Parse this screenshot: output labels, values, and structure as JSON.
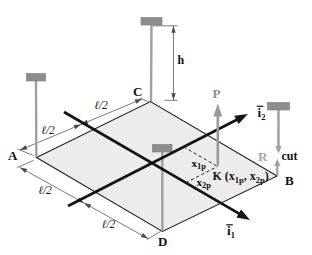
{
  "colors": {
    "background": "#ffffff",
    "plate_fill": "#ececec",
    "plate_edge": "#1f1f1f",
    "support_bar_gray": "#8d8d8d",
    "support_rod_gray": "#a0a0a0",
    "force_gray": "#9a9a9a",
    "axis_black": "#141414",
    "dimension_gray": "#6b6b6b"
  },
  "plate": {
    "corner_a": "A",
    "corner_b": "B",
    "corner_c": "C",
    "corner_d": "D"
  },
  "dimensions": {
    "half_span": "ℓ/2",
    "height": "h"
  },
  "forces": {
    "load": "P",
    "reaction": "R",
    "cut": "cut"
  },
  "axes": {
    "i1": {
      "base": "i",
      "sub": "1"
    },
    "i2": {
      "base": "i",
      "sub": "2"
    }
  },
  "point_k": {
    "prefix": "K (x",
    "sub1": "1p",
    "mid": ", x",
    "sub2": "2p",
    "suffix": ")"
  },
  "coordinates": {
    "x1": {
      "base": "x",
      "sub": "1p"
    },
    "x2": {
      "base": "x",
      "sub": "2p"
    }
  }
}
